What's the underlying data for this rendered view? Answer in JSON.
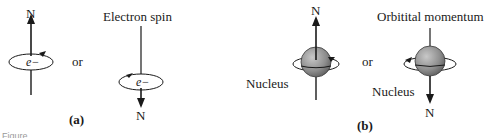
{
  "figure": {
    "panel_a": {
      "label": "(a)",
      "left_diagram": {
        "pole_label": "N",
        "particle_label": "e−",
        "direction": "up"
      },
      "connector": "or",
      "right_diagram": {
        "title": "Electron spin",
        "pole_label": "N",
        "particle_label": "e−",
        "direction": "down"
      }
    },
    "panel_b": {
      "label": "(b)",
      "left_diagram": {
        "pole_label": "N",
        "body_label": "Nucleus",
        "direction": "up"
      },
      "connector": "or",
      "right_diagram": {
        "title": "Orbitital momentum",
        "pole_label": "N",
        "body_label": "Nucleus",
        "direction": "down"
      }
    },
    "caption": "Figure"
  },
  "colors": {
    "line": "#1a1a1a",
    "sphere_light": "#b5b5b5",
    "sphere_dark": "#5e5e5e",
    "background": "#ffffff"
  }
}
